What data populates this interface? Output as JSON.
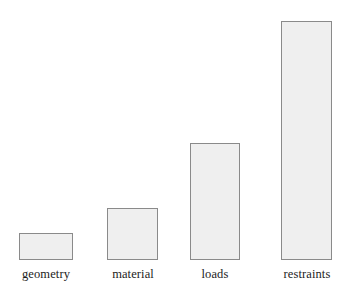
{
  "chart_data": {
    "type": "bar",
    "title": "",
    "subtitle": "",
    "xlabel": "",
    "ylabel": "",
    "categories": [
      "geometry",
      "material",
      "loads",
      "restraints"
    ],
    "values": [
      27,
      52,
      117,
      239
    ],
    "ylim": [
      0,
      250
    ],
    "grid": false,
    "legend": null,
    "legend_position": "none",
    "annotations": [],
    "tick_labels": {
      "x": [
        "geometry",
        "material",
        "loads",
        "restraints"
      ],
      "y": []
    },
    "axis_visible": {
      "x": false,
      "y": false
    },
    "style": {
      "bar_fill": "#efefef",
      "bar_border": "#8a8a8a",
      "background": "#ffffff",
      "label_color": "#1c1c1c"
    },
    "bar_geometry": [
      {
        "name": "geometry",
        "left": 19,
        "top": 233,
        "width": 54,
        "height": 27
      },
      {
        "name": "material",
        "left": 107,
        "top": 208,
        "width": 51,
        "height": 52
      },
      {
        "name": "loads",
        "left": 190,
        "top": 143,
        "width": 50,
        "height": 117
      },
      {
        "name": "restraints",
        "left": 281,
        "top": 21,
        "width": 51,
        "height": 239
      }
    ],
    "label_geometry": [
      {
        "left": 10,
        "top": 268,
        "width": 72
      },
      {
        "left": 98,
        "top": 268,
        "width": 70
      },
      {
        "left": 184,
        "top": 268,
        "width": 62
      },
      {
        "left": 270,
        "top": 268,
        "width": 74
      }
    ]
  }
}
